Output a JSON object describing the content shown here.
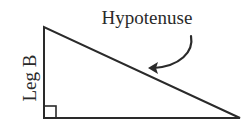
{
  "diagram": {
    "type": "right-triangle",
    "labels": {
      "hypotenuse": "Hypotenuse",
      "leg_b": "Leg B"
    },
    "colors": {
      "stroke": "#2a2a2a",
      "background": "#ffffff"
    }
  }
}
